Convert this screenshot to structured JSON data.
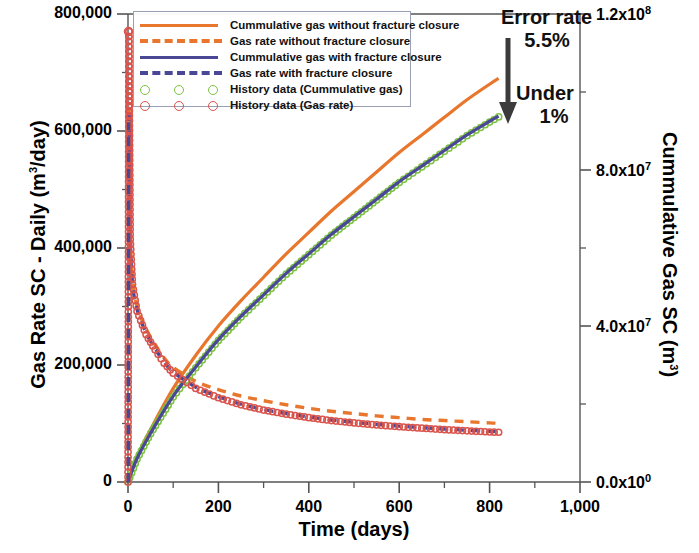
{
  "chart_data": {
    "type": "line",
    "title": "",
    "xlabel": "Time (days)",
    "ylabel_left": "Gas Rate SC - Daily (m3/day)",
    "ylabel_right": "Cummulative Gas SC (m3)",
    "xlim": [
      0,
      1000
    ],
    "xticks": [
      0,
      200,
      400,
      600,
      800,
      1000
    ],
    "xticklabels": [
      "0",
      "200",
      "400",
      "600",
      "800",
      "1,000"
    ],
    "ylim_left": [
      0,
      800000
    ],
    "yticks_left": [
      0,
      200000,
      400000,
      600000,
      800000
    ],
    "yticklabels_left": [
      "0",
      "200,000",
      "400,000",
      "600,000",
      "800,000"
    ],
    "ylim_right": [
      0,
      120000000
    ],
    "yticks_right": [
      0,
      40000000,
      80000000,
      120000000
    ],
    "yticklabels_right": [
      "0.0x10",
      "4.0x10",
      "8.0x10",
      "1.2x10"
    ],
    "yticklabels_right_exp": [
      "0",
      "7",
      "7",
      "8"
    ],
    "grid": false,
    "legend_position": "upper left",
    "minor_ticks": true,
    "series": [
      {
        "name": "Cummulative gas without fracture closure",
        "axis": "right",
        "style": "solid",
        "color": "#E8762C",
        "x": [
          0,
          20,
          50,
          100,
          150,
          200,
          250,
          300,
          350,
          400,
          450,
          500,
          550,
          600,
          650,
          700,
          750,
          800,
          820
        ],
        "y": [
          0,
          6500000,
          13500000,
          24000000,
          32500000,
          40000000,
          46500000,
          52500000,
          58500000,
          64000000,
          69500000,
          74500000,
          79500000,
          84500000,
          89000000,
          93500000,
          98000000,
          102000000,
          103500000
        ]
      },
      {
        "name": "Gas rate without fracture closure",
        "axis": "left",
        "style": "dashed",
        "color": "#E8762C",
        "x": [
          0,
          2,
          5,
          10,
          20,
          40,
          60,
          80,
          100,
          150,
          200,
          250,
          300,
          350,
          400,
          450,
          500,
          550,
          600,
          650,
          700,
          750,
          800,
          820
        ],
        "y": [
          0,
          620000,
          430000,
          350000,
          300000,
          262000,
          235000,
          212000,
          196000,
          172000,
          158000,
          147000,
          139000,
          132000,
          126000,
          121000,
          117000,
          113000,
          110000,
          107000,
          105000,
          103000,
          101000,
          100500
        ]
      },
      {
        "name": "Cummulative gas with fracture closure",
        "axis": "right",
        "style": "solid",
        "color": "#4A4796",
        "x": [
          0,
          20,
          50,
          100,
          150,
          200,
          250,
          300,
          350,
          400,
          450,
          500,
          550,
          600,
          650,
          700,
          750,
          800,
          820
        ],
        "y": [
          0,
          6000000,
          12500000,
          22000000,
          29500000,
          36500000,
          42500000,
          48000000,
          53500000,
          58500000,
          63500000,
          68000000,
          72500000,
          77000000,
          81000000,
          85000000,
          89000000,
          92500000,
          93800000
        ]
      },
      {
        "name": "Gas rate with fracture closure",
        "axis": "left",
        "style": "dashed",
        "color": "#4A4796",
        "x": [
          0,
          2,
          5,
          10,
          20,
          40,
          60,
          80,
          100,
          150,
          200,
          250,
          300,
          350,
          400,
          450,
          500,
          550,
          600,
          650,
          700,
          750,
          800,
          820
        ],
        "y": [
          0,
          615000,
          420000,
          340000,
          295000,
          255000,
          228000,
          205000,
          188000,
          162000,
          146000,
          133000,
          124000,
          117000,
          111000,
          106000,
          102000,
          98500,
          95500,
          93000,
          90500,
          88500,
          86500,
          86000
        ]
      },
      {
        "name": "History data (Cummulative gas)",
        "axis": "right",
        "style": "markers",
        "color": "#7DC242",
        "x": [
          0,
          20,
          50,
          100,
          150,
          200,
          250,
          300,
          350,
          400,
          450,
          500,
          550,
          600,
          650,
          700,
          750,
          800,
          820
        ],
        "y": [
          0,
          5900000,
          12400000,
          21800000,
          29300000,
          36300000,
          42300000,
          47800000,
          53300000,
          58300000,
          63300000,
          67800000,
          72300000,
          76800000,
          80800000,
          84800000,
          88800000,
          92300000,
          93600000
        ]
      },
      {
        "name": "History data (Gas rate)",
        "axis": "left",
        "style": "markers",
        "color": "#D9544C",
        "x": [
          0,
          2,
          5,
          10,
          20,
          40,
          60,
          80,
          100,
          150,
          200,
          250,
          300,
          350,
          400,
          450,
          500,
          550,
          600,
          650,
          700,
          750,
          800,
          820
        ],
        "y": [
          0,
          770000,
          415000,
          338000,
          292000,
          252000,
          226000,
          203000,
          186000,
          160000,
          144000,
          132000,
          123000,
          116000,
          110000,
          105000,
          101000,
          97500,
          94500,
          92000,
          89500,
          87500,
          85500,
          85000
        ]
      }
    ],
    "annotations": [
      {
        "text": "Error rate",
        "value": "5.5%"
      },
      {
        "text": "Under",
        "value": "1%"
      }
    ]
  },
  "legend": {
    "items": [
      {
        "label": "Cummulative gas without fracture closure",
        "color": "#E8762C",
        "style": "solid"
      },
      {
        "label": "Gas rate without fracture closure",
        "color": "#E8762C",
        "style": "dashed"
      },
      {
        "label": "Cummulative gas with fracture closure",
        "color": "#4A4796",
        "style": "solid"
      },
      {
        "label": "Gas rate with fracture closure",
        "color": "#4A4796",
        "style": "dashed"
      },
      {
        "label": "History data (Cummulative gas)",
        "color": "#7DC242",
        "style": "markers"
      },
      {
        "label": "History data (Gas rate)",
        "color": "#D9544C",
        "style": "markers"
      }
    ]
  },
  "annotations": {
    "error_rate_line1": "Error rate",
    "error_rate_line2": "5.5%",
    "under_line1": "Under",
    "under_line2": "1%",
    "arrow_color": "#3B3B3B"
  },
  "axes": {
    "x_title": "Time (days)",
    "y_left_title_pre": "Gas Rate SC - Daily (m",
    "y_left_title_sup": "3",
    "y_left_title_post": "/day)",
    "y_right_title_pre": "Cummulative Gas SC (m",
    "y_right_title_sup": "3",
    "y_right_title_post": ")"
  }
}
